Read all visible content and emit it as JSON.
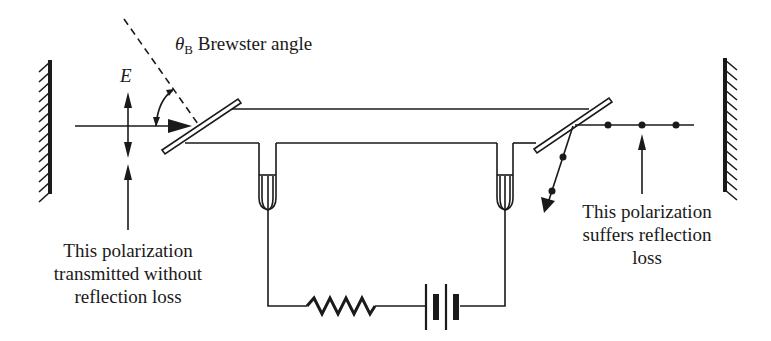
{
  "diagram": {
    "labels": {
      "field_symbol": "E",
      "theta_symbol": "θ",
      "theta_subscript": "B",
      "brewster_label": "Brewster angle",
      "left_caption": [
        "This polarization",
        "transmitted without",
        "reflection loss"
      ],
      "right_caption": [
        "This polarization",
        "suffers reflection",
        "loss"
      ]
    },
    "components": [
      {
        "id": "left-mirror",
        "type": "mirror"
      },
      {
        "id": "right-mirror",
        "type": "mirror"
      },
      {
        "id": "left-brewster-window",
        "type": "window"
      },
      {
        "id": "right-brewster-window",
        "type": "window"
      },
      {
        "id": "discharge-tube",
        "type": "tube"
      },
      {
        "id": "left-electrode",
        "type": "electrode"
      },
      {
        "id": "right-electrode",
        "type": "electrode"
      },
      {
        "id": "resistor",
        "type": "resistor"
      },
      {
        "id": "battery",
        "type": "battery"
      }
    ],
    "colors": {
      "ink": "#1a1a1a",
      "background": "#ffffff"
    }
  }
}
